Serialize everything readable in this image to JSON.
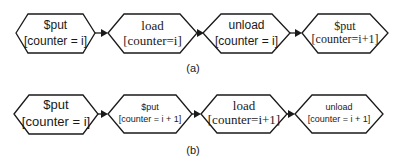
{
  "diagram": {
    "row_a": {
      "caption": "(a)",
      "nodes": [
        {
          "line1": "$put",
          "line2": "[counter = i]"
        },
        {
          "line1": "load",
          "line2": "[counter=i]"
        },
        {
          "line1": "unload",
          "line2": "[counter = i]"
        },
        {
          "line1": "$put",
          "line2": "[counter=i+1]"
        }
      ]
    },
    "row_b": {
      "caption": "(b)",
      "nodes": [
        {
          "line1": "$put",
          "line2": "[counter = i]"
        },
        {
          "line1": "$put",
          "line2": "[counter = i + 1]"
        },
        {
          "line1": "load",
          "line2": "[counter=i+1]"
        },
        {
          "line1": "unload",
          "line2": "[counter = i + 1]"
        }
      ]
    },
    "colors": {
      "stroke": "#1a1a1a",
      "fill": "#ffffff"
    }
  }
}
